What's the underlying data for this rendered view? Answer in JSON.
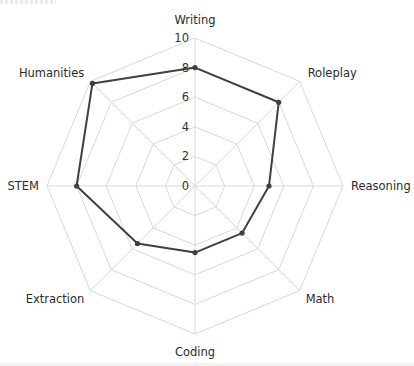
{
  "chart_data": {
    "type": "radar",
    "title": "",
    "categories": [
      "Writing",
      "Roleplay",
      "Reasoning",
      "Math",
      "Coding",
      "Extraction",
      "STEM",
      "Humanities"
    ],
    "series": [
      {
        "name": "Score",
        "values": [
          8.0,
          8.0,
          5.0,
          4.5,
          4.5,
          5.5,
          8.0,
          9.8
        ],
        "color": "#404040"
      }
    ],
    "radial_ticks": [
      0,
      2,
      4,
      6,
      8,
      10
    ],
    "rlim": [
      0,
      10
    ],
    "grid": true,
    "grid_color": "#d9d9d9",
    "legend": "none"
  },
  "labels": {
    "categories": [
      "Writing",
      "Roleplay",
      "Reasoning",
      "Math",
      "Coding",
      "Extraction",
      "STEM",
      "Humanities"
    ],
    "ticks": [
      "0",
      "2",
      "4",
      "6",
      "8",
      "10"
    ]
  }
}
